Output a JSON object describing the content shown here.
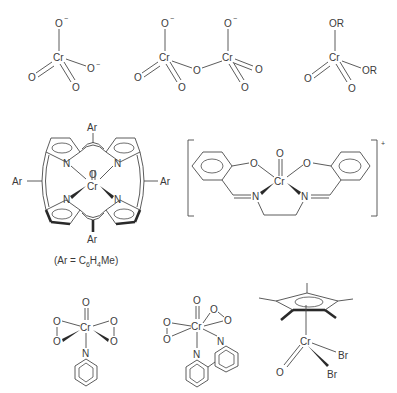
{
  "figure": {
    "background": "#ffffff",
    "ink_color": "#3a3a3a"
  },
  "structures": [
    {
      "id": "chromate",
      "name": "chromate anion",
      "atoms": {
        "center": "Cr",
        "top": "O",
        "top_charge": "−",
        "right": "O",
        "right_charge": "−",
        "left": "O",
        "bottom": "O"
      }
    },
    {
      "id": "dichromate",
      "name": "dichromate anion",
      "atoms": {
        "cr1": "Cr",
        "cr2": "Cr",
        "bridge": "O",
        "o1_top": "O",
        "o1_top_charge": "−",
        "o2_top": "O",
        "o2_top_charge": "−",
        "o1_left": "O",
        "o1_bottom": "O",
        "o2_right": "O",
        "o2_bottom": "O"
      }
    },
    {
      "id": "chromate-ester",
      "name": "chromate diester",
      "atoms": {
        "center": "Cr",
        "top": "OR",
        "right": "OR",
        "left": "O",
        "bottom": "O"
      }
    },
    {
      "id": "oxo-porphyrin",
      "name": "oxochromium porphyrin",
      "atoms": {
        "center": "Cr",
        "oxo": "O",
        "n1": "N",
        "n2": "N",
        "n3": "N",
        "n4": "N",
        "ar_top": "Ar",
        "ar_left": "Ar",
        "ar_right": "Ar",
        "ar_bottom": "Ar"
      },
      "caption": {
        "prefix": "(Ar = C",
        "sub1": "6",
        "mid": "H",
        "sub2": "4",
        "suffix": "Me)"
      }
    },
    {
      "id": "oxo-salen",
      "name": "oxochromium salen cation",
      "atoms": {
        "center": "Cr",
        "oxo": "O",
        "o_left": "O",
        "o_right": "O",
        "n_left": "N",
        "n_right": "N"
      },
      "charge": "+"
    },
    {
      "id": "peroxo-pyridine",
      "name": "chromium peroxo pyridine complex",
      "atoms": {
        "center": "Cr",
        "oxo": "O",
        "o1": "O",
        "o2": "O",
        "o3": "O",
        "o4": "O",
        "n": "N"
      }
    },
    {
      "id": "peroxo-bipyridine",
      "name": "chromium peroxo bipyridine complex",
      "atoms": {
        "center": "Cr",
        "oxo": "O",
        "o1": "O",
        "o2": "O",
        "o3": "O",
        "o4": "O",
        "n1": "N",
        "n2": "N"
      }
    },
    {
      "id": "cp-star-oxo-dibromide",
      "name": "Cp* oxochromium dibromide",
      "atoms": {
        "center": "Cr",
        "oxo": "O",
        "br1": "Br",
        "br2": "Br"
      }
    }
  ]
}
